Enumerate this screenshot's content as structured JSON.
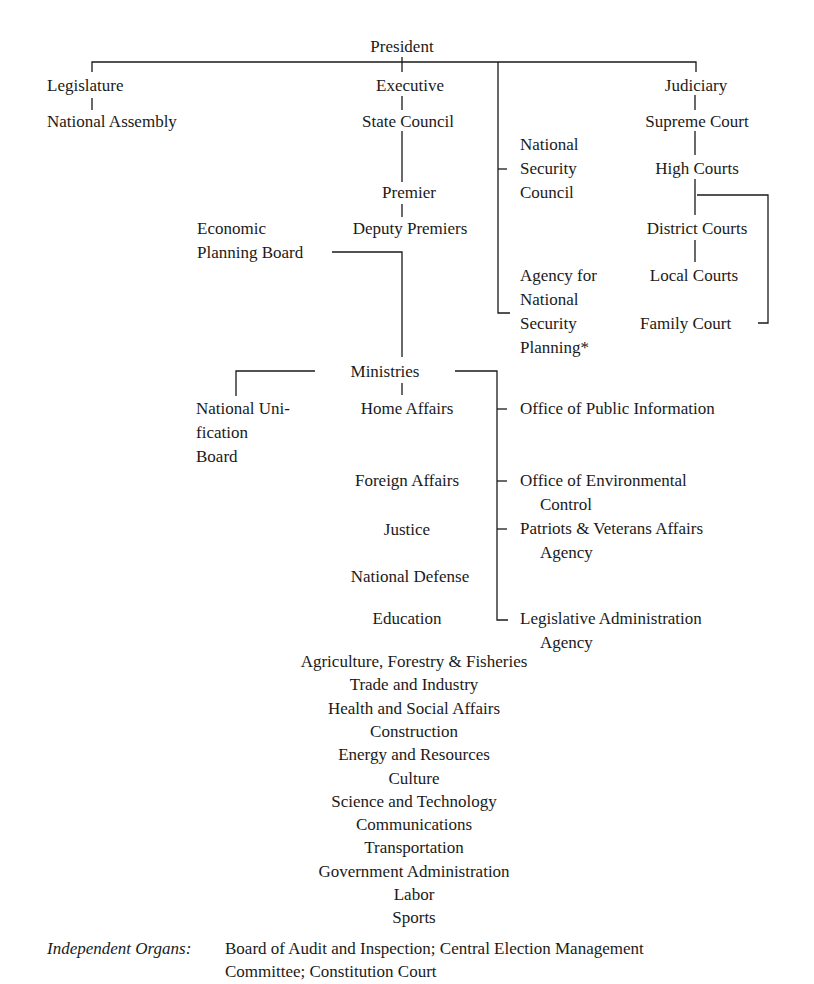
{
  "top": {
    "president": "President"
  },
  "legislature": {
    "branch": "Legislature",
    "body": "National Assembly"
  },
  "executive": {
    "branch": "Executive",
    "state_council": "State Council",
    "premier": "Premier",
    "deputy_premiers": "Deputy Premiers",
    "economic_planning_board_line1": "Economic",
    "economic_planning_board_line2": "Planning Board"
  },
  "security": {
    "nsc_lines": [
      "National",
      "Security",
      "Council"
    ],
    "ansp_lines": [
      "Agency for",
      "National",
      "Security",
      "Planning*"
    ]
  },
  "judiciary": {
    "branch": "Judiciary",
    "courts": [
      "Supreme Court",
      "High Courts",
      "District Courts",
      "Local Courts",
      "Family Court"
    ]
  },
  "ministries": {
    "label": "Ministries",
    "national_unification_board_lines": [
      "National Uni-",
      "fication",
      "Board"
    ],
    "column_items": [
      "Home Affairs",
      "Foreign Affairs",
      "Justice",
      "National Defense",
      "Education"
    ],
    "centered_items": [
      "Agriculture, Forestry & Fisheries",
      "Trade and Industry",
      "Health and Social Affairs",
      "Construction",
      "Energy and Resources",
      "Culture",
      "Science and Technology",
      "Communications",
      "Transportation",
      "Government Administration",
      "Labor",
      "Sports"
    ]
  },
  "offices": [
    {
      "line1": "Office of Public Information",
      "line2": ""
    },
    {
      "line1": "Office of Environmental",
      "line2": "Control"
    },
    {
      "line1": "Patriots & Veterans Affairs",
      "line2": "Agency"
    },
    {
      "line1": "Legislative Administration",
      "line2": "Agency"
    }
  ],
  "footer": {
    "label": "Independent Organs:",
    "line1": "Board of Audit and Inspection; Central Election Management",
    "line2": "Committee; Constitution Court"
  }
}
